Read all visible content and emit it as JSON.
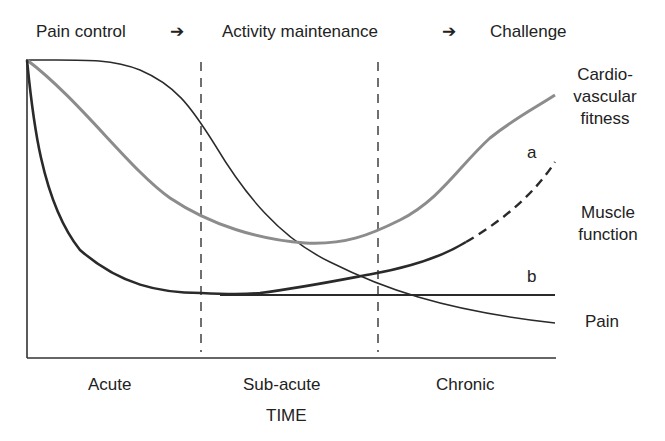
{
  "header": {
    "phases": [
      "Pain control",
      "Activity maintenance",
      "Challenge"
    ],
    "arrow_glyph": "➔"
  },
  "curves": {
    "cardio_label_line1": "Cardio-",
    "cardio_label_line2": "vascular",
    "cardio_label_line3": "fitness",
    "muscle_label_line1": "Muscle",
    "muscle_label_line2": "function",
    "pain_label": "Pain",
    "branch_a": "a",
    "branch_b": "b"
  },
  "xaxis": {
    "stages": [
      "Acute",
      "Sub-acute",
      "Chronic"
    ],
    "title": "TIME"
  },
  "colors": {
    "dark_line": "#2a2a2a",
    "gray_line": "#8c8c8c",
    "axis": "#333333"
  }
}
